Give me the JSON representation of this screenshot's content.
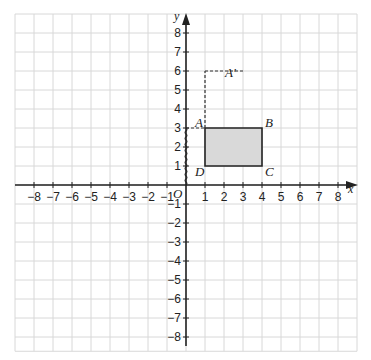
{
  "diagram": {
    "type": "coordinate-grid-translation",
    "x_axis": {
      "label": "x",
      "min": -8,
      "max": 8,
      "ticks": [
        -8,
        -7,
        -6,
        -5,
        -4,
        -3,
        -2,
        -1,
        1,
        2,
        3,
        4,
        5,
        6,
        7,
        8
      ]
    },
    "y_axis": {
      "label": "y",
      "min": -8,
      "max": 8,
      "ticks": [
        8,
        7,
        6,
        5,
        4,
        3,
        2,
        1,
        -1,
        -2,
        -3,
        -4,
        -5,
        -6,
        -7,
        -8
      ]
    },
    "origin_label": "O",
    "grid": {
      "x_range": [
        -9,
        9
      ],
      "y_range": [
        -8.75,
        9
      ],
      "on": true
    },
    "rectangle": {
      "vertices": [
        {
          "label": "A",
          "x": 1,
          "y": 3
        },
        {
          "label": "B",
          "x": 4,
          "y": 3
        },
        {
          "label": "C",
          "x": 4,
          "y": 1
        },
        {
          "label": "D",
          "x": 1,
          "y": 1
        }
      ],
      "fill": "#d9d9d9",
      "stroke": "#222222"
    },
    "image_point": {
      "label": "A′",
      "x": 3,
      "y": 6
    },
    "dashed_paths": [
      {
        "from": [
          0,
          3
        ],
        "to": [
          1,
          3
        ]
      },
      {
        "from": [
          1,
          3
        ],
        "to": [
          1,
          6
        ]
      },
      {
        "from": [
          1,
          6
        ],
        "to": [
          3,
          6
        ]
      }
    ],
    "wavy_path": {
      "from": [
        0,
        0
      ],
      "to": [
        0,
        3
      ]
    },
    "colors": {
      "grid": "#d8d8d8",
      "axis": "#222222",
      "dash": "#333333"
    }
  },
  "labels": {
    "x_axis_name": "x",
    "y_axis_name": "y",
    "origin": "O",
    "A": "A",
    "B": "B",
    "C": "C",
    "D": "D",
    "A_prime": "A′"
  }
}
